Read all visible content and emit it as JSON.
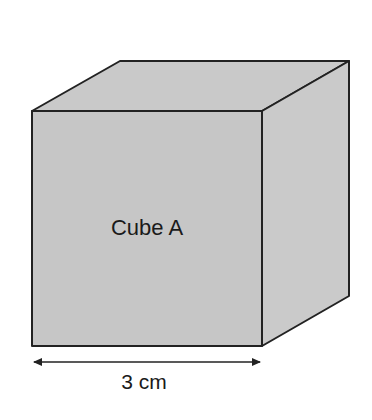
{
  "diagram": {
    "type": "cube-3d",
    "face_color": "#c8c8c8",
    "edge_color": "#222222",
    "label": "Cube A",
    "dimension": {
      "value": "3",
      "unit": "cm",
      "text": "3 cm"
    }
  }
}
